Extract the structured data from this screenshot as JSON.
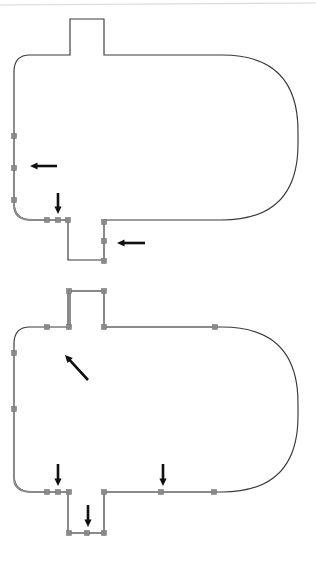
{
  "page": {
    "background_color": "#ffffff",
    "width": 316,
    "height": 562
  },
  "styles": {
    "outline_color": "#3a3a3c",
    "selected_segment_color": "#8a8a8c",
    "handle_fill": "#8a8a8c",
    "handle_stroke": "#6f6f72",
    "arrow_color": "#101012",
    "faint_rule_color": "#d9d9dd",
    "outline_width": 1.15,
    "selected_width": 2.0,
    "handle_size": 5
  },
  "faint_rule": {
    "name": "page-top-rule",
    "x1": 0,
    "y1": 5,
    "x2": 316,
    "y2": 3
  },
  "figures": [
    {
      "id": "figure-top",
      "label": "Upper tank outline",
      "outline_path": "M 70 19 L 70 55 L 30 55 Q 14 55 14 72 L 14 202 Q 14 220 32 220 L 68 220 L 68 260 L 104 260 L 104 220 L 222 220 Q 298 220 298 144 L 298 131 Q 298 55 222 55 L 104 55 L 104 19 Z",
      "selected_segments": [
        {
          "name": "selected-left-wall-upper",
          "d": "M 14 135 L 14 205"
        },
        {
          "name": "selected-bottom-left-corner",
          "d": "M 14 205 Q 14 220 32 220 L 68 220"
        },
        {
          "name": "selected-notch-right-wall",
          "d": "M 104 222 L 104 261"
        }
      ],
      "handles": [
        {
          "name": "handle-left-wall-top",
          "x": 14,
          "y": 136
        },
        {
          "name": "handle-left-wall-mid",
          "x": 14,
          "y": 168
        },
        {
          "name": "handle-left-wall-bottom",
          "x": 14,
          "y": 200
        },
        {
          "name": "handle-bottom-left-a",
          "x": 47,
          "y": 220
        },
        {
          "name": "handle-bottom-left-b",
          "x": 58,
          "y": 220
        },
        {
          "name": "handle-notch-left-top",
          "x": 68,
          "y": 220
        },
        {
          "name": "handle-notch-right-top",
          "x": 104,
          "y": 222
        },
        {
          "name": "handle-notch-right-mid",
          "x": 104,
          "y": 241
        },
        {
          "name": "handle-notch-right-bottom",
          "x": 104,
          "y": 261
        }
      ],
      "arrows": [
        {
          "name": "arrow-left-inward",
          "direction": "left",
          "tip_x": 30,
          "tip_y": 166,
          "tail_x": 57,
          "tail_y": 166
        },
        {
          "name": "arrow-notch-down",
          "direction": "down",
          "tip_x": 58,
          "tip_y": 214,
          "tail_x": 58,
          "tail_y": 193
        },
        {
          "name": "arrow-lower-right-inward",
          "direction": "left",
          "tip_x": 117,
          "tip_y": 243,
          "tail_x": 145,
          "tail_y": 243
        }
      ]
    },
    {
      "id": "figure-bottom",
      "label": "Lower tank outline",
      "outline_path": "M 70 291 L 70 327 L 30 327 Q 14 327 14 344 L 14 475 Q 14 492 32 492 L 68 492 L 68 533 L 104 533 L 104 492 L 222 492 Q 298 492 298 416 L 298 403 Q 298 327 222 327 L 104 327 L 104 291 Z",
      "selected_segments": [
        {
          "name": "selected-top-notch-box",
          "d": "M 68 327 L 68 291 L 104 291 L 104 327"
        },
        {
          "name": "selected-top-edge-right",
          "d": "M 104 327 L 216 327"
        },
        {
          "name": "selected-left-wall",
          "d": "M 14 350 L 14 478"
        },
        {
          "name": "selected-bottom-left-corner",
          "d": "M 14 478 Q 14 492 32 492 L 68 492"
        },
        {
          "name": "selected-bottom-notch-box",
          "d": "M 68 492 L 68 533 L 104 533 L 104 492"
        },
        {
          "name": "selected-bottom-edge-right",
          "d": "M 104 492 L 216 492"
        }
      ],
      "handles": [
        {
          "name": "handle-top-notch-left-top",
          "x": 69,
          "y": 291
        },
        {
          "name": "handle-top-notch-right-top",
          "x": 104,
          "y": 291
        },
        {
          "name": "handle-top-edge-left",
          "x": 47,
          "y": 327
        },
        {
          "name": "handle-top-notch-left-base",
          "x": 69,
          "y": 327
        },
        {
          "name": "handle-top-notch-right-base",
          "x": 104,
          "y": 327
        },
        {
          "name": "handle-top-edge-right",
          "x": 215,
          "y": 327
        },
        {
          "name": "handle-left-wall-top",
          "x": 14,
          "y": 353
        },
        {
          "name": "handle-left-wall-mid",
          "x": 14,
          "y": 409
        },
        {
          "name": "handle-bottom-left-a",
          "x": 47,
          "y": 492
        },
        {
          "name": "handle-bottom-left-b",
          "x": 58,
          "y": 492
        },
        {
          "name": "handle-bottom-notch-left-top",
          "x": 69,
          "y": 492
        },
        {
          "name": "handle-bottom-notch-right-top",
          "x": 104,
          "y": 492
        },
        {
          "name": "handle-bottom-edge-mid",
          "x": 161,
          "y": 492
        },
        {
          "name": "handle-bottom-edge-right",
          "x": 214,
          "y": 492
        },
        {
          "name": "handle-bottom-notch-left-base",
          "x": 69,
          "y": 533
        },
        {
          "name": "handle-bottom-notch-mid-base",
          "x": 87,
          "y": 533
        },
        {
          "name": "handle-bottom-notch-right-base",
          "x": 104,
          "y": 533
        }
      ],
      "arrows": [
        {
          "name": "arrow-diagonal-up-left",
          "direction": "up-left",
          "tip_x": 65,
          "tip_y": 355,
          "tail_x": 88,
          "tail_y": 380
        },
        {
          "name": "arrow-left-down",
          "direction": "down",
          "tip_x": 58,
          "tip_y": 486,
          "tail_x": 58,
          "tail_y": 464
        },
        {
          "name": "arrow-right-down",
          "direction": "down",
          "tip_x": 163,
          "tip_y": 486,
          "tail_x": 163,
          "tail_y": 464
        },
        {
          "name": "arrow-notch-down",
          "direction": "down",
          "tip_x": 88,
          "tip_y": 527,
          "tail_x": 88,
          "tail_y": 505
        }
      ]
    }
  ]
}
